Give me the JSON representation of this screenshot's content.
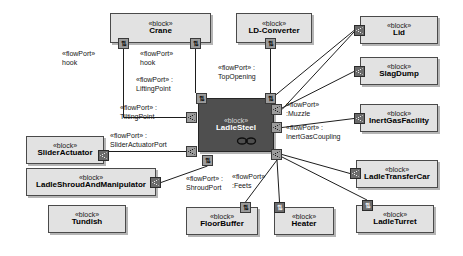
{
  "diagram": {
    "type": "SysML Internal Block Diagram",
    "stereotype": "«block»",
    "selected_block": "LadleSteel"
  },
  "blocks": [
    {
      "id": "crane",
      "stereo": "«block»",
      "name": "Crane",
      "x": 110,
      "y": 13,
      "w": 101,
      "h": 30,
      "selected": false
    },
    {
      "id": "ldconverter",
      "stereo": "«block»",
      "name": "LD-Converter",
      "x": 236,
      "y": 13,
      "w": 76,
      "h": 30,
      "selected": false
    },
    {
      "id": "lid",
      "stereo": "«block»",
      "name": "Lid",
      "x": 360,
      "y": 16,
      "w": 78,
      "h": 28,
      "selected": false
    },
    {
      "id": "slagdump",
      "stereo": "«block»",
      "name": "SlagDump",
      "x": 360,
      "y": 57,
      "w": 78,
      "h": 28,
      "selected": false
    },
    {
      "id": "inertgas",
      "stereo": "«block»",
      "name": "InertGasFacility",
      "x": 360,
      "y": 104,
      "w": 78,
      "h": 28,
      "selected": false
    },
    {
      "id": "ladlesteel",
      "stereo": "«block»",
      "name": "LadleSteel",
      "x": 198,
      "y": 98,
      "w": 76,
      "h": 54,
      "selected": true
    },
    {
      "id": "slideract",
      "stereo": "«block»",
      "name": "SliderActuator",
      "x": 26,
      "y": 136,
      "w": 78,
      "h": 28,
      "selected": false
    },
    {
      "id": "ladleshroud",
      "stereo": "«block»",
      "name": "LadleShroudAndManipulator",
      "x": 26,
      "y": 168,
      "w": 130,
      "h": 28,
      "selected": false
    },
    {
      "id": "tundish",
      "stereo": "«block»",
      "name": "Tundish",
      "x": 48,
      "y": 205,
      "w": 78,
      "h": 28,
      "selected": false
    },
    {
      "id": "floorbuffer",
      "stereo": "«block»",
      "name": "FloorBuffer",
      "x": 186,
      "y": 207,
      "w": 72,
      "h": 28,
      "selected": false
    },
    {
      "id": "heater",
      "stereo": "«block»",
      "name": "Heater",
      "x": 274,
      "y": 207,
      "w": 60,
      "h": 28,
      "selected": false
    },
    {
      "id": "ladleturret",
      "stereo": "«block»",
      "name": "LadleTurret",
      "x": 356,
      "y": 205,
      "w": 78,
      "h": 28,
      "selected": false
    },
    {
      "id": "transfercar",
      "stereo": "«block»",
      "name": "LadleTransferCar",
      "x": 356,
      "y": 160,
      "w": 82,
      "h": 28,
      "selected": false
    }
  ],
  "ports": [
    {
      "id": "p-crane-left",
      "owner": "Crane",
      "x": 118,
      "y": 38,
      "style": "light",
      "glyph": "arrows"
    },
    {
      "id": "p-crane-right",
      "owner": "Crane",
      "x": 190,
      "y": 38,
      "style": "light",
      "glyph": "arrows"
    },
    {
      "id": "p-ldconv-bottom",
      "owner": "LD-Converter",
      "x": 265,
      "y": 38,
      "style": "light",
      "glyph": "arrows"
    },
    {
      "id": "p-lid-left",
      "owner": "Lid",
      "x": 354,
      "y": 25,
      "style": "dark",
      "glyph": "flow"
    },
    {
      "id": "p-slagdump-left",
      "owner": "SlagDump",
      "x": 354,
      "y": 66,
      "style": "dark",
      "glyph": "flow"
    },
    {
      "id": "p-inertgas-left",
      "owner": "InertGasFacility",
      "x": 354,
      "y": 113,
      "style": "dark",
      "glyph": "flow"
    },
    {
      "id": "p-ladle-liftingpoint",
      "owner": "LadleSteel",
      "x": 196,
      "y": 93,
      "style": "light",
      "glyph": "arrows"
    },
    {
      "id": "p-ladle-topopening",
      "owner": "LadleSteel",
      "x": 265,
      "y": 93,
      "style": "light",
      "glyph": "arrows"
    },
    {
      "id": "p-ladle-tilting",
      "owner": "LadleSteel",
      "x": 186,
      "y": 112,
      "style": "light",
      "glyph": "flow"
    },
    {
      "id": "p-ladle-muzzle",
      "owner": "LadleSteel",
      "x": 271,
      "y": 104,
      "style": "light",
      "glyph": "flow"
    },
    {
      "id": "p-ladle-inertcoup",
      "owner": "LadleSteel",
      "x": 271,
      "y": 122,
      "style": "light",
      "glyph": "flow"
    },
    {
      "id": "p-ladle-slideract",
      "owner": "LadleSteel",
      "x": 186,
      "y": 146,
      "style": "light",
      "glyph": "flow"
    },
    {
      "id": "p-ladle-shroudport",
      "owner": "LadleSteel",
      "x": 202,
      "y": 155,
      "style": "light",
      "glyph": "arrows"
    },
    {
      "id": "p-ladle-feets",
      "owner": "LadleSteel",
      "x": 271,
      "y": 149,
      "style": "light",
      "glyph": "flow"
    },
    {
      "id": "p-slideract-right",
      "owner": "SliderActuator",
      "x": 98,
      "y": 150,
      "style": "dark",
      "glyph": "flow"
    },
    {
      "id": "p-shroud-right",
      "owner": "LadleShroudAndManipulator",
      "x": 150,
      "y": 177,
      "style": "dark",
      "glyph": "flow"
    },
    {
      "id": "p-floorbuffer-top",
      "owner": "FloorBuffer",
      "x": 240,
      "y": 202,
      "style": "light",
      "glyph": "arrows"
    },
    {
      "id": "p-heater-top",
      "owner": "Heater",
      "x": 274,
      "y": 202,
      "style": "dark",
      "glyph": "arrows"
    },
    {
      "id": "p-ladleturret-top",
      "owner": "LadleTurret",
      "x": 362,
      "y": 200,
      "style": "dark",
      "glyph": "arrows"
    },
    {
      "id": "p-transfercar-left",
      "owner": "LadleTransferCar",
      "x": 350,
      "y": 168,
      "style": "dark",
      "glyph": "flow"
    }
  ],
  "port_labels": [
    {
      "id": "lbl-hook-left",
      "line1": "«flowPort»",
      "line2": "hook",
      "x": 62,
      "y": 50
    },
    {
      "id": "lbl-hook-right",
      "line1": "«flowPort»",
      "line2": "hook",
      "x": 140,
      "y": 50
    },
    {
      "id": "lbl-liftingpoint",
      "line1": "«flowPort» :",
      "line2": "LiftingPoint",
      "x": 136,
      "y": 76
    },
    {
      "id": "lbl-tiltingpoint",
      "line1": "«flowPort» :",
      "line2": "TiltingPoint",
      "x": 120,
      "y": 104
    },
    {
      "id": "lbl-topopening",
      "line1": "«flowPort» :",
      "line2": "TopOpening",
      "x": 218,
      "y": 64
    },
    {
      "id": "lbl-muzzle",
      "line1": "«flowPort»",
      "line2": ":Muzzle",
      "x": 286,
      "y": 101
    },
    {
      "id": "lbl-inertgascoupling",
      "line1": "«flowPort» :",
      "line2": "InertGasCoupling",
      "x": 286,
      "y": 124
    },
    {
      "id": "lbl-slideractuatorport",
      "line1": "«flowPort» :",
      "line2": "SliderActuatorPort",
      "x": 110,
      "y": 132
    },
    {
      "id": "lbl-shroudport",
      "line1": "«flowPort» :",
      "line2": "ShroudPort",
      "x": 186,
      "y": 175
    },
    {
      "id": "lbl-feets",
      "line1": "«flowPort»",
      "line2": ":Feets",
      "x": 232,
      "y": 173
    }
  ],
  "connectors": [
    {
      "id": "c-crane-left-tilting",
      "from": "p-crane-left",
      "to": "p-ladle-tilting",
      "path": "M123.5,49 L123.5,117.5 L186,117.5"
    },
    {
      "id": "c-crane-right-lifting",
      "from": "p-crane-right",
      "to": "p-ladle-liftingpoint",
      "path": "M195.5,49 L195.5,93"
    },
    {
      "id": "c-ldconv-topopening",
      "from": "p-ldconv-bottom",
      "to": "p-ladle-topopening",
      "path": "M270.5,49 L270.5,93"
    },
    {
      "id": "c-lid-topopening",
      "from": "p-lid-left",
      "to": "p-ladle-topopening",
      "path": "M354,30.5 L272,98"
    },
    {
      "id": "c-lid-muzzle",
      "from": "p-lid-left",
      "to": "p-ladle-muzzle",
      "path": "M354,32 L282,109.5"
    },
    {
      "id": "c-slagdump-muzzle",
      "from": "p-slagdump-left",
      "to": "p-ladle-muzzle",
      "path": "M354,71.5 L282,108"
    },
    {
      "id": "c-inertgas-coupling",
      "from": "p-inertgas-left",
      "to": "p-ladle-inertcoup",
      "path": "M354,118.5 L282,127.5"
    },
    {
      "id": "c-slideract-ladle",
      "from": "p-slideract-right",
      "to": "p-ladle-slideract",
      "path": "M109,151.5 L186,151.5"
    },
    {
      "id": "c-shroud-ladle",
      "from": "p-shroud-right",
      "to": "p-ladle-shroudport",
      "path": "M161,182.5 L207.5,166"
    },
    {
      "id": "c-feets-floorbuffer",
      "from": "p-ladle-feets",
      "to": "p-floorbuffer-top",
      "path": "M277,160 L245.5,202"
    },
    {
      "id": "c-feets-heater",
      "from": "p-ladle-feets",
      "to": "p-heater-top",
      "path": "M277,160 L279.5,202"
    },
    {
      "id": "c-feets-transfercar",
      "from": "p-ladle-feets",
      "to": "p-transfercar-left",
      "path": "M282,154.5 L350,173.5"
    },
    {
      "id": "c-feets-ladleturret",
      "from": "p-ladle-feets",
      "to": "p-ladleturret-top",
      "path": "M282,157 L367,200"
    }
  ]
}
